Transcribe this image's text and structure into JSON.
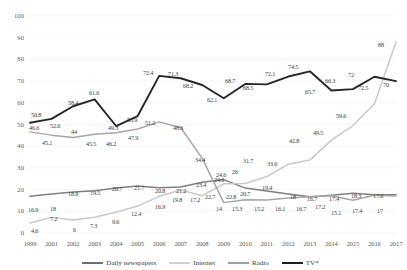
{
  "chart_data": {
    "type": "line",
    "title": "",
    "subtitle": "",
    "xlabel": "",
    "ylabel": "",
    "ylim": [
      0,
      100
    ],
    "ytick_labels": [
      "0",
      "10",
      "20",
      "30",
      "40",
      "50",
      "60",
      "70",
      "80",
      "90",
      "100"
    ],
    "yticks": [
      0,
      10,
      20,
      30,
      40,
      50,
      60,
      70,
      80,
      90,
      100
    ],
    "grid": true,
    "legend_position": "bottom",
    "categories": [
      "1999",
      "2001",
      "2002",
      "2003",
      "2004",
      "2005",
      "2006",
      "2007",
      "2008",
      "2009",
      "2010",
      "2011",
      "2012",
      "2013",
      "2014",
      "2015",
      "2016",
      "2017"
    ],
    "series": [
      {
        "name": "Daily newspapers",
        "color": "#7f7f7f",
        "values": [
          16.9,
          18,
          18.9,
          19.5,
          20.7,
          21.7,
          20.8,
          21.2,
          23.4,
          24.6,
          20.7,
          19.4,
          18,
          16.7,
          17.4,
          18.3,
          17.6,
          17.6
        ]
      },
      {
        "name": "Internet",
        "color": "#c8c8c8",
        "values": [
          4.6,
          7.2,
          6,
          7.3,
          9.6,
          12.4,
          16.9,
          19.8,
          17.2,
          22.7,
          22.8,
          26,
          31.7,
          33.6,
          42.8,
          49.5,
          59.6,
          88
        ]
      },
      {
        "name": "Radio",
        "color": "#a6a6a6",
        "values": [
          46.6,
          45.1,
          44,
          45.5,
          46.2,
          47.9,
          51.2,
          48.6,
          34.4,
          14,
          15.3,
          15.2,
          16.1,
          16.7,
          17.2,
          15.1,
          17.4,
          17
        ]
      },
      {
        "name": "TV*",
        "color": "#262626",
        "values": [
          50.8,
          52.6,
          58.4,
          61.6,
          49.3,
          53.9,
          72.4,
          71.3,
          68.2,
          62.1,
          68.7,
          68.5,
          72.1,
          74.5,
          65.7,
          66.3,
          72,
          70
        ]
      }
    ],
    "point_labels": [
      {
        "series": "TV*",
        "index": 0,
        "text": "50.8",
        "x": 31,
        "y": 111
      },
      {
        "series": "TV*",
        "index": 1,
        "text": "52.6",
        "x": 50,
        "y": 122
      },
      {
        "series": "TV*",
        "index": 2,
        "text": "58.4",
        "x": 68,
        "y": 99
      },
      {
        "series": "TV*",
        "index": 3,
        "text": "61.6",
        "x": 89,
        "y": 89
      },
      {
        "series": "TV*",
        "index": 4,
        "text": "49.3",
        "x": 108,
        "y": 124
      },
      {
        "series": "TV*",
        "index": 5,
        "text": "53.9",
        "x": 127,
        "y": 116
      },
      {
        "series": "TV*",
        "index": 6,
        "text": "72.4",
        "x": 143,
        "y": 69
      },
      {
        "series": "TV*",
        "index": 7,
        "text": "71.3",
        "x": 168,
        "y": 70
      },
      {
        "series": "TV*",
        "index": 8,
        "text": "68.2",
        "x": 183,
        "y": 82
      },
      {
        "series": "TV*",
        "index": 9,
        "text": "62.1",
        "x": 207,
        "y": 96
      },
      {
        "series": "TV*",
        "index": 10,
        "text": "68.7",
        "x": 225,
        "y": 77
      },
      {
        "series": "TV*",
        "index": 11,
        "text": "68.5",
        "x": 243,
        "y": 84
      },
      {
        "series": "TV*",
        "index": 12,
        "text": "72.1",
        "x": 265,
        "y": 70
      },
      {
        "series": "TV*",
        "index": 13,
        "text": "74.5",
        "x": 288,
        "y": 63
      },
      {
        "series": "TV*",
        "index": 14,
        "text": "65.7",
        "x": 305,
        "y": 88
      },
      {
        "series": "TV*",
        "index": 15,
        "text": "66.3",
        "x": 325,
        "y": 77
      },
      {
        "series": "TV*",
        "index": 16,
        "text": "72",
        "x": 348,
        "y": 71
      },
      {
        "series": "TV*",
        "index": 17,
        "text": "72.5",
        "x": 358,
        "y": 84
      },
      {
        "series": "TV*",
        "index": 18,
        "text": "70",
        "x": 383,
        "y": 81
      },
      {
        "series": "Radio",
        "index": 0,
        "text": "46.6",
        "x": 29,
        "y": 124
      },
      {
        "series": "Radio",
        "index": 1,
        "text": "45.1",
        "x": 42,
        "y": 139
      },
      {
        "series": "Radio",
        "index": 2,
        "text": "44",
        "x": 71,
        "y": 128
      },
      {
        "series": "Radio",
        "index": 3,
        "text": "45.5",
        "x": 86,
        "y": 140
      },
      {
        "series": "Radio",
        "index": 4,
        "text": "46.2",
        "x": 106,
        "y": 140
      },
      {
        "series": "Radio",
        "index": 5,
        "text": "47.9",
        "x": 128,
        "y": 134
      },
      {
        "series": "Radio",
        "index": 6,
        "text": "51.2",
        "x": 145,
        "y": 119
      },
      {
        "series": "Radio",
        "index": 7,
        "text": "48.6",
        "x": 173,
        "y": 124
      },
      {
        "series": "Radio",
        "index": 8,
        "text": "34.4",
        "x": 195,
        "y": 156
      },
      {
        "series": "Radio",
        "index": 9,
        "text": "24.6",
        "x": 216,
        "y": 171
      },
      {
        "series": "Radio",
        "index": 10,
        "text": "26",
        "x": 232,
        "y": 168
      },
      {
        "series": "Radio",
        "index": 11,
        "text": "31.7",
        "x": 243,
        "y": 157
      },
      {
        "series": "Radio",
        "index": 12,
        "text": "33.6",
        "x": 267,
        "y": 160
      },
      {
        "series": "Radio",
        "index": 13,
        "text": "42.8",
        "x": 289,
        "y": 137
      },
      {
        "series": "Radio",
        "index": 14,
        "text": "49.5",
        "x": 313,
        "y": 129
      },
      {
        "series": "Radio",
        "index": 15,
        "text": "59.6",
        "x": 336,
        "y": 112
      },
      {
        "series": "Radio",
        "index": 16,
        "text": "88",
        "x": 378,
        "y": 41
      },
      {
        "series": "Daily newspapers",
        "index": 0,
        "text": "16.9",
        "x": 28,
        "y": 206
      },
      {
        "series": "Daily newspapers",
        "index": 1,
        "text": "18",
        "x": 50,
        "y": 205
      },
      {
        "series": "Daily newspapers",
        "index": 2,
        "text": "18.9",
        "x": 68,
        "y": 190
      },
      {
        "series": "Daily newspapers",
        "index": 3,
        "text": "19.5",
        "x": 90,
        "y": 189
      },
      {
        "series": "Daily newspapers",
        "index": 4,
        "text": "20.7",
        "x": 112,
        "y": 185
      },
      {
        "series": "Daily newspapers",
        "index": 5,
        "text": "21.7",
        "x": 134,
        "y": 184
      },
      {
        "series": "Daily newspapers",
        "index": 6,
        "text": "20.8",
        "x": 155,
        "y": 187
      },
      {
        "series": "Daily newspapers",
        "index": 7,
        "text": "21.2",
        "x": 176,
        "y": 187
      },
      {
        "series": "Daily newspapers",
        "index": 8,
        "text": "23.4",
        "x": 196,
        "y": 181
      },
      {
        "series": "Daily newspapers",
        "index": 9,
        "text": "24.6",
        "x": 214,
        "y": 176
      },
      {
        "series": "Daily newspapers",
        "index": 10,
        "text": "20.7",
        "x": 240,
        "y": 190
      },
      {
        "series": "Daily newspapers",
        "index": 11,
        "text": "19.4",
        "x": 262,
        "y": 184
      },
      {
        "series": "Daily newspapers",
        "index": 12,
        "text": "18",
        "x": 290,
        "y": 193
      },
      {
        "series": "Daily newspapers",
        "index": 13,
        "text": "16.7",
        "x": 307,
        "y": 195
      },
      {
        "series": "Daily newspapers",
        "index": 14,
        "text": "17.4",
        "x": 329,
        "y": 195
      },
      {
        "series": "Daily newspapers",
        "index": 15,
        "text": "18.3",
        "x": 351,
        "y": 192
      },
      {
        "series": "Daily newspapers",
        "index": 16,
        "text": "17.6",
        "x": 373,
        "y": 192
      },
      {
        "series": "Internet",
        "index": 0,
        "text": "4.6",
        "x": 31,
        "y": 227
      },
      {
        "series": "Internet",
        "index": 1,
        "text": "7.2",
        "x": 50,
        "y": 215
      },
      {
        "series": "Internet",
        "index": 2,
        "text": "6",
        "x": 73,
        "y": 226
      },
      {
        "series": "Internet",
        "index": 3,
        "text": "7.3",
        "x": 90,
        "y": 222
      },
      {
        "series": "Internet",
        "index": 4,
        "text": "9.6",
        "x": 112,
        "y": 218
      },
      {
        "series": "Internet",
        "index": 5,
        "text": "12.4",
        "x": 131,
        "y": 210
      },
      {
        "series": "Internet",
        "index": 6,
        "text": "16.9",
        "x": 155,
        "y": 203
      },
      {
        "series": "Internet",
        "index": 7,
        "text": "19.8",
        "x": 172,
        "y": 196
      },
      {
        "series": "Internet",
        "index": 8,
        "text": "17.2",
        "x": 190,
        "y": 196
      },
      {
        "series": "Internet",
        "index": 9,
        "text": "22.7",
        "x": 205,
        "y": 193
      },
      {
        "series": "Internet",
        "index": 10,
        "text": "22.8",
        "x": 226,
        "y": 193
      },
      {
        "series": "Internet",
        "index": 11,
        "text": "14",
        "x": 216,
        "y": 205
      },
      {
        "series": "Internet",
        "index": 12,
        "text": "15.3",
        "x": 232,
        "y": 205
      },
      {
        "series": "Internet",
        "index": 13,
        "text": "15.2",
        "x": 254,
        "y": 205
      },
      {
        "series": "Internet",
        "index": 14,
        "text": "16.1",
        "x": 275,
        "y": 205
      },
      {
        "series": "Internet",
        "index": 15,
        "text": "16.7",
        "x": 296,
        "y": 205
      },
      {
        "series": "Internet",
        "index": 16,
        "text": "17.2",
        "x": 315,
        "y": 203
      },
      {
        "series": "Internet",
        "index": 17,
        "text": "15.1",
        "x": 331,
        "y": 209
      },
      {
        "series": "Internet",
        "index": 18,
        "text": "17.4",
        "x": 352,
        "y": 207
      },
      {
        "series": "Internet",
        "index": 19,
        "text": "17",
        "x": 377,
        "y": 207
      }
    ]
  },
  "legend": {
    "items": [
      {
        "label": "Daily newspapers",
        "color": "#6e6e6e"
      },
      {
        "label": "Internet",
        "color": "#cfcfcf"
      },
      {
        "label": "Radio",
        "color": "#9e9e9e"
      },
      {
        "label": "TV*",
        "color": "#1f1f1f"
      }
    ]
  }
}
